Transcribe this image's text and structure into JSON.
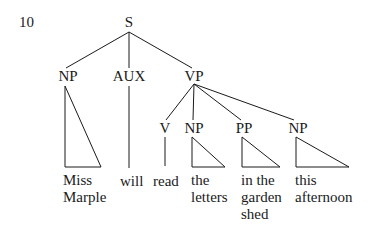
{
  "example_number": "10",
  "tree": {
    "root": "S",
    "nodes": {
      "np_subject": "NP",
      "aux": "AUX",
      "vp": "VP",
      "v": "V",
      "np_object": "NP",
      "pp": "PP",
      "np_time": "NP"
    },
    "leaves": {
      "np_subject": "Miss\nMarple",
      "aux": "will",
      "v": "read",
      "np_object": "the\nletters",
      "pp": "in the\ngarden\nshed",
      "np_time": "this\nafternoon"
    }
  },
  "colors": {
    "ink": "#1a1a1a",
    "background": "#ffffff"
  }
}
